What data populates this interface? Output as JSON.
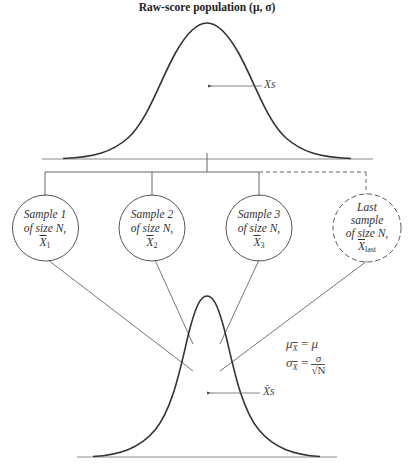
{
  "title": {
    "text": "Raw-score population (μ, σ)"
  },
  "population_curve": {
    "label": "Xs",
    "arrow_direction": "left"
  },
  "samples": [
    {
      "line1": "Sample 1",
      "line2": "of size N,",
      "mean_symbol": "X",
      "mean_subscript": "1",
      "style": "solid"
    },
    {
      "line1": "Sample 2",
      "line2": "of size N,",
      "mean_symbol": "X",
      "mean_subscript": "2",
      "style": "solid"
    },
    {
      "line1": "Sample 3",
      "line2": "of size N,",
      "mean_symbol": "X",
      "mean_subscript": "3",
      "style": "solid"
    },
    {
      "line0": "Last",
      "line1": "sample",
      "line2": "of size N,",
      "mean_symbol": "X",
      "mean_subscript": "last",
      "style": "dashed"
    }
  ],
  "sampling_distribution": {
    "label": "X̄s",
    "formula_mean": {
      "lhs": "μ",
      "sub": "X",
      "rhs": "μ"
    },
    "formula_sd": {
      "lhs": "σ",
      "sub": "X",
      "numerator": "σ",
      "denominator": "√N"
    },
    "equals": "="
  },
  "colors": {
    "curve": "#333333",
    "lines": "#666666",
    "baseline": "#888888",
    "text": "#333333"
  }
}
